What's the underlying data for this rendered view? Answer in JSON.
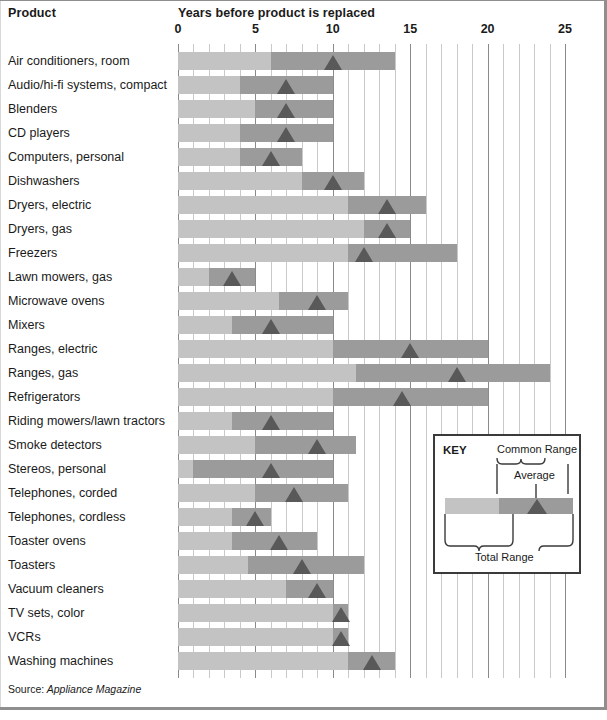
{
  "header": {
    "product_label": "Product",
    "axis_title": "Years before product is replaced"
  },
  "source": {
    "label": "Source:",
    "value": " Appliance Magazine"
  },
  "key": {
    "title": "KEY",
    "common_range_label": "Common Range",
    "average_label": "Average",
    "total_range_label": "Total Range"
  },
  "colors": {
    "total_range": "#c3c3c3",
    "common_range": "#9b9b9b",
    "average": "#595959",
    "minor_gridline": "#c9c9c9",
    "major_gridline": "#8a8a8a"
  },
  "chart_data": {
    "type": "bar",
    "title": "Years before product is replaced",
    "xlabel": "Years before product is replaced",
    "ylabel": "Product",
    "xlim": [
      0,
      25
    ],
    "xticks": [
      0,
      5,
      10,
      15,
      20,
      25
    ],
    "minor_tick_step": 1,
    "grid": true,
    "legend": {
      "position": "inset-bottom-right",
      "entries": [
        "Total Range",
        "Common Range",
        "Average"
      ]
    },
    "series": [
      {
        "name": "Total Range",
        "key": "total"
      },
      {
        "name": "Common Range",
        "key": "common"
      },
      {
        "name": "Average",
        "key": "average"
      }
    ],
    "categories": [
      "Air conditioners, room",
      "Audio/hi-fi systems, compact",
      "Blenders",
      "CD players",
      "Computers, personal",
      "Dishwashers",
      "Dryers, electric",
      "Dryers, gas",
      "Freezers",
      "Lawn mowers, gas",
      "Microwave ovens",
      "Mixers",
      "Ranges, electric",
      "Ranges, gas",
      "Refrigerators",
      "Riding mowers/lawn tractors",
      "Smoke detectors",
      "Stereos, personal",
      "Telephones, corded",
      "Telephones, cordless",
      "Toaster ovens",
      "Toasters",
      "Vacuum cleaners",
      "TV sets, color",
      "VCRs",
      "Washing machines"
    ],
    "rows": [
      {
        "label": "Air conditioners, room",
        "total": [
          0,
          14
        ],
        "common": [
          6,
          14
        ],
        "average": 10
      },
      {
        "label": "Audio/hi-fi systems, compact",
        "total": [
          0,
          10
        ],
        "common": [
          4,
          10
        ],
        "average": 7
      },
      {
        "label": "Blenders",
        "total": [
          0,
          10
        ],
        "common": [
          5,
          10
        ],
        "average": 7
      },
      {
        "label": "CD players",
        "total": [
          0,
          10
        ],
        "common": [
          4,
          10
        ],
        "average": 7
      },
      {
        "label": "Computers, personal",
        "total": [
          0,
          8
        ],
        "common": [
          4,
          8
        ],
        "average": 6
      },
      {
        "label": "Dishwashers",
        "total": [
          0,
          12
        ],
        "common": [
          8,
          12
        ],
        "average": 10
      },
      {
        "label": "Dryers, electric",
        "total": [
          0,
          16
        ],
        "common": [
          11,
          16
        ],
        "average": 13.5
      },
      {
        "label": "Dryers, gas",
        "total": [
          0,
          15
        ],
        "common": [
          12,
          15
        ],
        "average": 13.5
      },
      {
        "label": "Freezers",
        "total": [
          0,
          18
        ],
        "common": [
          11,
          18
        ],
        "average": 12
      },
      {
        "label": "Lawn mowers, gas",
        "total": [
          0,
          5
        ],
        "common": [
          2,
          5
        ],
        "average": 3.5
      },
      {
        "label": "Microwave ovens",
        "total": [
          0,
          11
        ],
        "common": [
          6.5,
          11
        ],
        "average": 9
      },
      {
        "label": "Mixers",
        "total": [
          0,
          10
        ],
        "common": [
          3.5,
          10
        ],
        "average": 6
      },
      {
        "label": "Ranges, electric",
        "total": [
          0,
          20
        ],
        "common": [
          10,
          20
        ],
        "average": 15
      },
      {
        "label": "Ranges, gas",
        "total": [
          0,
          24
        ],
        "common": [
          11.5,
          24
        ],
        "average": 18
      },
      {
        "label": "Refrigerators",
        "total": [
          0,
          20
        ],
        "common": [
          10,
          20
        ],
        "average": 14.5
      },
      {
        "label": "Riding mowers/lawn tractors",
        "total": [
          0,
          10
        ],
        "common": [
          3.5,
          10
        ],
        "average": 6
      },
      {
        "label": "Smoke detectors",
        "total": [
          0,
          11.5
        ],
        "common": [
          5,
          11.5
        ],
        "average": 9
      },
      {
        "label": "Stereos, personal",
        "total": [
          0,
          10
        ],
        "common": [
          1,
          10
        ],
        "average": 6
      },
      {
        "label": "Telephones, corded",
        "total": [
          0,
          11
        ],
        "common": [
          5,
          11
        ],
        "average": 7.5
      },
      {
        "label": "Telephones, cordless",
        "total": [
          0,
          6
        ],
        "common": [
          3.5,
          6
        ],
        "average": 5
      },
      {
        "label": "Toaster ovens",
        "total": [
          0,
          9
        ],
        "common": [
          3.5,
          9
        ],
        "average": 6.5
      },
      {
        "label": "Toasters",
        "total": [
          0,
          12
        ],
        "common": [
          4.5,
          12
        ],
        "average": 8
      },
      {
        "label": "Vacuum cleaners",
        "total": [
          0,
          10
        ],
        "common": [
          7,
          10
        ],
        "average": 9
      },
      {
        "label": "TV sets, color",
        "total": [
          0,
          11
        ],
        "common": [
          10,
          11
        ],
        "average": 10.5
      },
      {
        "label": "VCRs",
        "total": [
          0,
          11
        ],
        "common": [
          10,
          11
        ],
        "average": 10.5
      },
      {
        "label": "Washing machines",
        "total": [
          0,
          14
        ],
        "common": [
          11,
          14
        ],
        "average": 12.5
      }
    ]
  }
}
